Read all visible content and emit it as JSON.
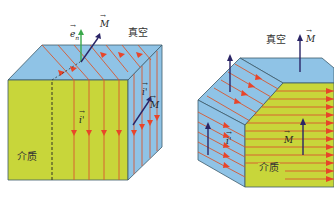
{
  "colors": {
    "vacuum_face": "#8fc3e6",
    "medium_face": "#c8d63a",
    "current_line": "#d9572f",
    "arrow_head": "#e8452a",
    "vector_M": "#2a2466",
    "normal_vector": "#3aa84a",
    "edge": "#3d5a6a"
  },
  "left_figure": {
    "vacuum_label": "真空",
    "medium_label": "介质",
    "normal_vector_label": "e",
    "normal_vector_subscript": "n",
    "magnetization_top_label": "M",
    "magnetization_side_label": "M",
    "current_front_label": "i'",
    "current_side_label": "i'"
  },
  "right_figure": {
    "vacuum_label": "真空",
    "medium_label": "介质",
    "magnetization_top_label": "M",
    "magnetization_front_label": "M",
    "current_side_label": "i'"
  }
}
